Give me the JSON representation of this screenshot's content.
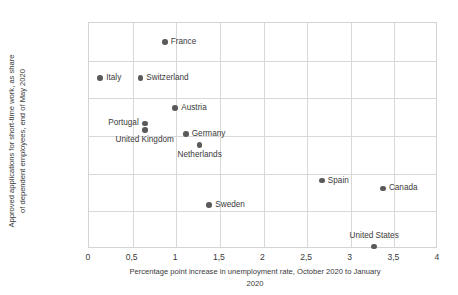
{
  "chart_data": {
    "type": "scatter",
    "title": "",
    "xlabel": "Percentage point increase in unemployment rate, October 2020 to January 2020",
    "ylabel": "Approved applications for short-time work, as share of dependent employees, end of May 2020",
    "xlim": [
      0,
      4
    ],
    "ylim": [
      0,
      60
    ],
    "xticks": [
      "0",
      "0,5",
      "1",
      "1,5",
      "2",
      "2,5",
      "3",
      "3,5",
      "4"
    ],
    "xtick_values": [
      0,
      0.5,
      1,
      1.5,
      2,
      2.5,
      3,
      3.5,
      4
    ],
    "yticks": [
      "0",
      "10",
      "20",
      "30",
      "40",
      "50",
      "60"
    ],
    "ytick_values": [
      0,
      10,
      20,
      30,
      40,
      50,
      60
    ],
    "grid": "both",
    "legend": "none",
    "marker_color": "#5a5a5a",
    "points": [
      {
        "name": "France",
        "x": 0.88,
        "y": 54.7,
        "label_pos": "right"
      },
      {
        "name": "Italy",
        "x": 0.14,
        "y": 45.2,
        "label_pos": "right"
      },
      {
        "name": "Switzerland",
        "x": 0.6,
        "y": 45.2,
        "label_pos": "right"
      },
      {
        "name": "Portugal",
        "x": 0.65,
        "y": 33.1,
        "label_pos": "left"
      },
      {
        "name": "Austria",
        "x": 1.0,
        "y": 37.1,
        "label_pos": "right"
      },
      {
        "name": "United Kingdom",
        "x": 0.65,
        "y": 31.3,
        "label_pos": "below"
      },
      {
        "name": "Germany",
        "x": 1.12,
        "y": 30.2,
        "label_pos": "right"
      },
      {
        "name": "Netherlands",
        "x": 1.28,
        "y": 27.4,
        "label_pos": "below"
      },
      {
        "name": "Sweden",
        "x": 1.39,
        "y": 11.4,
        "label_pos": "right"
      },
      {
        "name": "Spain",
        "x": 2.68,
        "y": 17.9,
        "label_pos": "right"
      },
      {
        "name": "Canada",
        "x": 3.38,
        "y": 15.8,
        "label_pos": "right"
      },
      {
        "name": "United States",
        "x": 3.28,
        "y": 0.4,
        "label_pos": "above"
      }
    ]
  },
  "axes": {
    "y_title_line1": "Approved applications for short-time work, as share",
    "y_title_line2": "of dependent employees, end of May 2020",
    "x_title_line1": "Percentage point increase in unemployment rate, October 2020 to January",
    "x_title_line2": "2020"
  }
}
